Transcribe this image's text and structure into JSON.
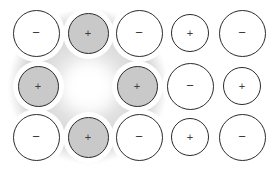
{
  "figure": {
    "width": 275,
    "height": 172,
    "background_color": "#ffffff",
    "outline_color": "#2b2b2b",
    "cation_fill": "#c9c9c9",
    "anion_fill": "#ffffff",
    "charge_text_color": "#3a3a3a",
    "glow_color": "#ffffff",
    "patch_color": "#d6d6d6"
  },
  "legend": {
    "positive_symbol": "+",
    "negative_symbol": "−"
  },
  "lattice": {
    "rows": 3,
    "columns": 5,
    "ions": [
      {
        "id": "r1c1",
        "row": 1,
        "col": 1,
        "charge": "−",
        "sign": "negative",
        "fill": "white",
        "cx": 36,
        "cy": 33,
        "d": 47
      },
      {
        "id": "r1c2",
        "row": 1,
        "col": 2,
        "charge": "+",
        "sign": "positive",
        "fill": "grey",
        "cx": 88,
        "cy": 33,
        "d": 41
      },
      {
        "id": "r1c3",
        "row": 1,
        "col": 3,
        "charge": "−",
        "sign": "negative",
        "fill": "white",
        "cx": 139,
        "cy": 33,
        "d": 47
      },
      {
        "id": "r1c4",
        "row": 1,
        "col": 4,
        "charge": "+",
        "sign": "positive",
        "fill": "white",
        "cx": 190,
        "cy": 33,
        "d": 38
      },
      {
        "id": "r1c5",
        "row": 1,
        "col": 5,
        "charge": "−",
        "sign": "negative",
        "fill": "white",
        "cx": 242,
        "cy": 33,
        "d": 47
      },
      {
        "id": "r2c1",
        "row": 2,
        "col": 1,
        "charge": "+",
        "sign": "positive",
        "fill": "grey",
        "cx": 38,
        "cy": 86,
        "d": 41
      },
      {
        "id": "r2c3",
        "row": 2,
        "col": 3,
        "charge": "+",
        "sign": "positive",
        "fill": "grey",
        "cx": 137,
        "cy": 86,
        "d": 41
      },
      {
        "id": "r2c4",
        "row": 2,
        "col": 4,
        "charge": "−",
        "sign": "negative",
        "fill": "white",
        "cx": 190,
        "cy": 86,
        "d": 47
      },
      {
        "id": "r2c5",
        "row": 2,
        "col": 5,
        "charge": "+",
        "sign": "positive",
        "fill": "white",
        "cx": 242,
        "cy": 86,
        "d": 38
      },
      {
        "id": "r3c1",
        "row": 3,
        "col": 1,
        "charge": "−",
        "sign": "negative",
        "fill": "white",
        "cx": 36,
        "cy": 137,
        "d": 47
      },
      {
        "id": "r3c2",
        "row": 3,
        "col": 2,
        "charge": "+",
        "sign": "positive",
        "fill": "grey",
        "cx": 88,
        "cy": 137,
        "d": 41
      },
      {
        "id": "r3c3",
        "row": 3,
        "col": 3,
        "charge": "−",
        "sign": "negative",
        "fill": "white",
        "cx": 139,
        "cy": 137,
        "d": 47
      },
      {
        "id": "r3c4",
        "row": 3,
        "col": 4,
        "charge": "+",
        "sign": "positive",
        "fill": "white",
        "cx": 190,
        "cy": 137,
        "d": 38
      },
      {
        "id": "r3c5",
        "row": 3,
        "col": 5,
        "charge": "−",
        "sign": "negative",
        "fill": "white",
        "cx": 242,
        "cy": 137,
        "d": 47
      }
    ],
    "vacancy": {
      "row": 2,
      "col": 2,
      "cx": 88,
      "cy": 86,
      "description": "empty lattice site shown as bright glow"
    }
  }
}
